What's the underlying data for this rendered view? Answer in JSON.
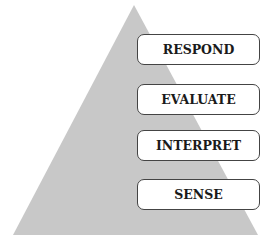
{
  "caption": "immediate action.",
  "colors": {
    "pyramid": "#c8c8c8",
    "box_border": "#444444",
    "box_bg": "#ffffff",
    "text": "#1a1a1a"
  },
  "levels": [
    {
      "label": "RESPOND"
    },
    {
      "label": "EVALUATE"
    },
    {
      "label": "INTERPRET"
    },
    {
      "label": "SENSE"
    }
  ]
}
